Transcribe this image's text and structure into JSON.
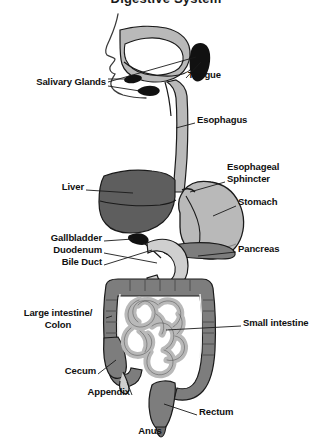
{
  "title": "Digestive System",
  "figure": {
    "style": "grayscale anatomical line diagram"
  },
  "palette": {
    "background": "#ffffff",
    "outline": "#1a1a1a",
    "text": "#101010",
    "leader_line": "#1a1a1a",
    "organ_dark": "#5e5e5e",
    "organ_mid": "#7d7d7d",
    "organ_light": "#b9b9b9",
    "organ_pale": "#cfcfcf",
    "organ_black": "#111111",
    "skin_outline": "#3a3a3a"
  },
  "labels": [
    {
      "id": "salivary-glands",
      "text": "Salivary Glands",
      "side": "left",
      "align": "r",
      "x": 12,
      "y": 81,
      "width": 94
    },
    {
      "id": "tongue",
      "text": "Tongue",
      "side": "right",
      "align": "l",
      "x": 188,
      "y": 74,
      "width": 60
    },
    {
      "id": "esophagus",
      "text": "Esophagus",
      "side": "right",
      "align": "l",
      "x": 197,
      "y": 119,
      "width": 74
    },
    {
      "id": "esophageal-sphincter",
      "text": "Esophageal\nSphincter",
      "side": "right",
      "align": "l",
      "x": 227,
      "y": 166,
      "width": 78
    },
    {
      "id": "liver",
      "text": "Liver",
      "side": "left",
      "align": "r",
      "x": 38,
      "y": 186,
      "width": 46
    },
    {
      "id": "stomach",
      "text": "Stomach",
      "side": "right",
      "align": "l",
      "x": 238,
      "y": 201,
      "width": 60
    },
    {
      "id": "gallbladder",
      "text": "Gallbladder",
      "side": "left",
      "align": "r",
      "x": 20,
      "y": 237,
      "width": 82
    },
    {
      "id": "duodenum",
      "text": "Duodenum",
      "side": "left",
      "align": "r",
      "x": 26,
      "y": 249,
      "width": 76
    },
    {
      "id": "bile-duct",
      "text": "Bile Duct",
      "side": "left",
      "align": "r",
      "x": 38,
      "y": 261,
      "width": 64
    },
    {
      "id": "pancreas",
      "text": "Pancreas",
      "side": "right",
      "align": "l",
      "x": 238,
      "y": 248,
      "width": 64
    },
    {
      "id": "large-intestine",
      "text": "Large intestine/\nColon",
      "side": "left",
      "align": "c",
      "x": 10,
      "y": 312,
      "width": 98
    },
    {
      "id": "small-intestine",
      "text": "Small intestine",
      "side": "right",
      "align": "l",
      "x": 243,
      "y": 322,
      "width": 88
    },
    {
      "id": "cecum",
      "text": "Cecum",
      "side": "left",
      "align": "r",
      "x": 40,
      "y": 370,
      "width": 56
    },
    {
      "id": "appendix",
      "text": "Appendix",
      "side": "left",
      "align": "r",
      "x": 60,
      "y": 391,
      "width": 70
    },
    {
      "id": "rectum",
      "text": "Rectum",
      "side": "right",
      "align": "l",
      "x": 199,
      "y": 411,
      "width": 54
    },
    {
      "id": "anus",
      "text": "Anus",
      "side": "below",
      "align": "c",
      "x": 128,
      "y": 430,
      "width": 44
    }
  ],
  "organs": [
    {
      "id": "oral-cavity",
      "name": "Oral cavity / mouth",
      "shade": "organ_light"
    },
    {
      "id": "tongue-shape",
      "name": "Tongue",
      "shade": "organ_black"
    },
    {
      "id": "salivary-gland-upper",
      "name": "Parotid gland",
      "shade": "organ_black"
    },
    {
      "id": "salivary-gland-lower",
      "name": "Submandibular gland",
      "shade": "organ_black"
    },
    {
      "id": "esophagus-tube",
      "name": "Esophagus",
      "shade": "organ_light"
    },
    {
      "id": "liver-shape",
      "name": "Liver",
      "shade": "organ_dark"
    },
    {
      "id": "gallbladder-shape",
      "name": "Gallbladder",
      "shade": "organ_black"
    },
    {
      "id": "stomach-shape",
      "name": "Stomach",
      "shade": "organ_light"
    },
    {
      "id": "duodenum-shape",
      "name": "Duodenum",
      "shade": "organ_pale"
    },
    {
      "id": "pancreas-shape",
      "name": "Pancreas",
      "shade": "organ_mid"
    },
    {
      "id": "large-intestine-shape",
      "name": "Large intestine / colon",
      "shade": "organ_mid"
    },
    {
      "id": "small-intestine-shape",
      "name": "Small intestine",
      "shade": "organ_light"
    },
    {
      "id": "cecum-shape",
      "name": "Cecum",
      "shade": "organ_mid"
    },
    {
      "id": "appendix-shape",
      "name": "Appendix",
      "shade": "organ_light"
    },
    {
      "id": "rectum-shape",
      "name": "Rectum",
      "shade": "organ_mid"
    },
    {
      "id": "anus-shape",
      "name": "Anus",
      "shade": "organ_mid"
    }
  ]
}
